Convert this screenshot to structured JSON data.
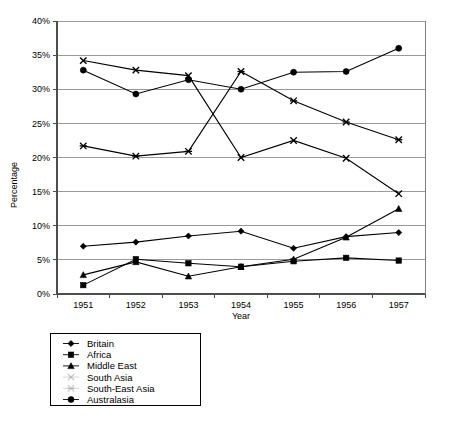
{
  "chart_data": {
    "type": "line",
    "title": "",
    "xlabel": "Year",
    "ylabel": "Percentage",
    "categories": [
      "1951",
      "1952",
      "1953",
      "1954",
      "1955",
      "1956",
      "1957"
    ],
    "x": [
      1951,
      1952,
      1953,
      1954,
      1955,
      1956,
      1957
    ],
    "ylim": [
      0,
      40
    ],
    "ytick_values": [
      0,
      5,
      10,
      15,
      20,
      25,
      30,
      35,
      40
    ],
    "ytick_labels": [
      "0%",
      "5%",
      "10%",
      "15%",
      "20%",
      "25%",
      "30%",
      "35%",
      "40%"
    ],
    "grid": true,
    "legend_position": "below-left",
    "series": [
      {
        "name": "Britain",
        "marker": "diamond",
        "values": [
          7.0,
          7.6,
          8.5,
          9.2,
          6.7,
          8.4,
          9.0
        ]
      },
      {
        "name": "Africa",
        "marker": "square",
        "values": [
          1.3,
          5.1,
          4.5,
          4.0,
          4.8,
          5.3,
          4.9
        ]
      },
      {
        "name": "Middle East",
        "marker": "triangle",
        "values": [
          2.8,
          4.7,
          2.6,
          4.0,
          5.1,
          8.3,
          12.5
        ]
      },
      {
        "name": "South Asia",
        "marker": "cross",
        "values": [
          34.2,
          32.8,
          32.0,
          20.0,
          22.5,
          19.9,
          14.7
        ]
      },
      {
        "name": "South-East Asia",
        "marker": "star",
        "values": [
          21.7,
          20.2,
          20.9,
          32.6,
          28.3,
          25.2,
          22.6
        ]
      },
      {
        "name": "Australasia",
        "marker": "circle",
        "values": [
          32.8,
          29.3,
          31.4,
          30.0,
          32.5,
          32.6,
          36.0
        ]
      }
    ]
  },
  "legend": {
    "items": [
      {
        "label": "Britain"
      },
      {
        "label": "Africa"
      },
      {
        "label": "Middle East"
      },
      {
        "label": "South Asia"
      },
      {
        "label": "South-East Asia"
      },
      {
        "label": "Australasia"
      }
    ]
  },
  "axes": {
    "y_title": "Percentage",
    "x_title": "Year"
  },
  "colors": {
    "line": "#000000",
    "grid": "#9a9a9a",
    "axis": "#4d4d4d",
    "background": "#ffffff",
    "faint_marker": "#bbbbbb"
  }
}
